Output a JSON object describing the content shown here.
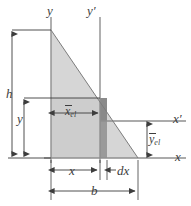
{
  "figure": {
    "axes": {
      "y_label": "y",
      "y_prime_label": "y′",
      "x_label": "x",
      "x_prime_label": "x′"
    },
    "dimensions": {
      "height_label": "h",
      "base_label": "b",
      "y_label": "y",
      "x_label": "x",
      "dx_label": "dx"
    },
    "centroid_labels": {
      "x_el_symbol": "x",
      "x_el_subscript": "el",
      "y_el_symbol": "y",
      "y_el_subscript": "el"
    },
    "colors": {
      "triangle_fill": "#d6d6d6",
      "rect_fill": "#cdcdcd",
      "strip_fill": "#9a9a9a",
      "strip_dark_fill": "#7d7d7d",
      "line": "#3d3d3d",
      "axis": "#808080",
      "background": "#ffffff"
    },
    "geometry": {
      "apex": [
        51,
        30
      ],
      "bottom_left": [
        51,
        158
      ],
      "bottom_right": [
        138,
        158
      ],
      "strip_left_x": 100,
      "strip_right_x": 107,
      "x_prime_axis_y": 121,
      "x_axis_y": 158,
      "y_axis_x": 51,
      "y_prime_axis_x": 100,
      "rect_top_y": 98
    }
  }
}
